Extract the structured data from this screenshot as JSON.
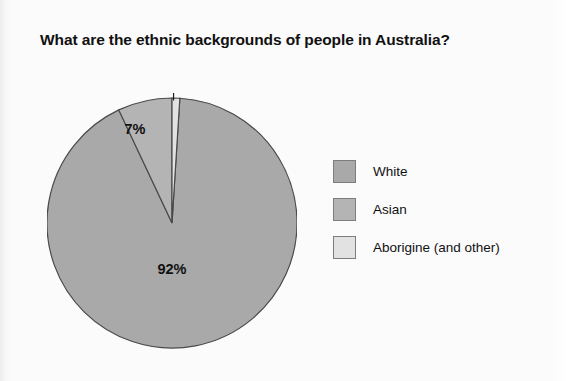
{
  "chart_data": {
    "type": "pie",
    "title": "What are the ethnic backgrounds of people in Australia?",
    "categories": [
      "White",
      "Asian",
      "Aborigine (and other)"
    ],
    "values": [
      92,
      7,
      1
    ],
    "value_labels": [
      "92%",
      "7%",
      "1%"
    ],
    "unit": "percent",
    "colors": [
      "#a9a9a9",
      "#b4b4b4",
      "#e2e2e2"
    ],
    "slice_border_color": "#4a4a4a",
    "start_angle_deg": 0,
    "direction": "clockwise-from-top",
    "legend_position": "right",
    "grid": false,
    "xlabel": "",
    "ylabel": ""
  },
  "title": {
    "text": "What are the ethnic backgrounds of people in Australia?"
  },
  "pie": {
    "labels": {
      "white": "92%",
      "asian": "7%",
      "aborigine": "1%"
    }
  },
  "legend": {
    "items": [
      {
        "label": "White",
        "color": "#a9a9a9"
      },
      {
        "label": "Asian",
        "color": "#b4b4b4"
      },
      {
        "label": "Aborigine (and other)",
        "color": "#e2e2e2"
      }
    ]
  }
}
